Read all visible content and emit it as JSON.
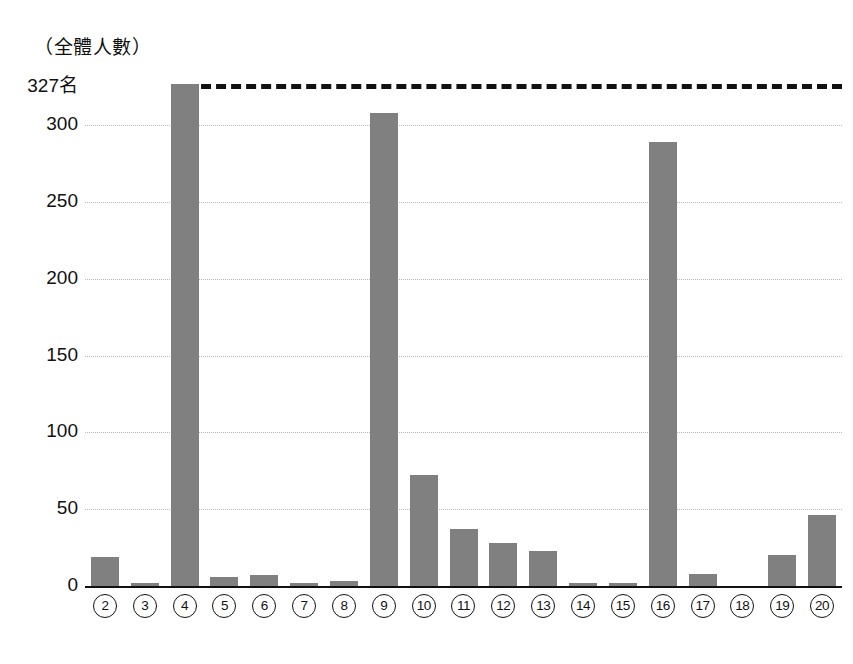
{
  "chart_data": {
    "type": "bar",
    "title": "（全體人數）",
    "xlabel": "",
    "ylabel": "",
    "ylim": [
      0,
      327
    ],
    "grid": true,
    "legend": null,
    "y_ticks": [
      0,
      50,
      100,
      150,
      200,
      250,
      300
    ],
    "y_tick_labels": [
      "0",
      "50",
      "100",
      "150",
      "200",
      "250",
      "300"
    ],
    "top_reference": {
      "value": 327,
      "label": "327名",
      "style": "dashed",
      "color": "#111111"
    },
    "bar_color": "#808080",
    "categories": [
      "②",
      "③",
      "④",
      "⑤",
      "⑥",
      "⑦",
      "⑧",
      "⑨",
      "⑩",
      "⑪",
      "⑫",
      "⑬",
      "⑭",
      "⑮",
      "⑯",
      "⑰",
      "⑱",
      "⑲",
      "⑳"
    ],
    "values": [
      19,
      2,
      327,
      6,
      7,
      2,
      3,
      308,
      72,
      37,
      28,
      23,
      2,
      2,
      289,
      8,
      0,
      20,
      46
    ]
  }
}
